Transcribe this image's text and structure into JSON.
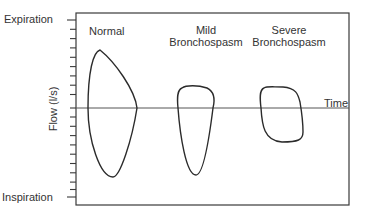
{
  "figure": {
    "y_axis": {
      "title": "Flow (l/s)",
      "top_label": "Expiration",
      "bottom_label": "Inspiration",
      "tick_count": 20
    },
    "x_axis": {
      "label": "Time"
    },
    "loops": [
      {
        "label_line1": "Normal",
        "label_line2": ""
      },
      {
        "label_line1": "Mild",
        "label_line2": "Bronchospasm"
      },
      {
        "label_line1": "Severe",
        "label_line2": "Bronchospasm"
      }
    ],
    "colors": {
      "line": "#2b2b2b",
      "frame": "#3a3a3a",
      "axis": "#555555",
      "background": "#ffffff"
    }
  }
}
